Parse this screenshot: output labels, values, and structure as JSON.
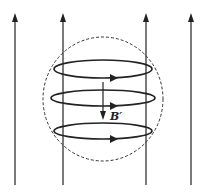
{
  "diagram": {
    "title": "",
    "field_lines": {
      "count": 4,
      "direction": "up",
      "x_positions": [
        15,
        63,
        146,
        191
      ]
    },
    "dashed_sphere": {
      "cx": 103,
      "cy": 99,
      "rx": 60,
      "ry": 62
    },
    "current_loops": [
      {
        "cy": 69,
        "direction_arrow": "right"
      },
      {
        "cy": 98,
        "direction_arrow": "right"
      },
      {
        "cy": 131,
        "direction_arrow": "right"
      }
    ],
    "induced_field": {
      "direction": "down",
      "label": "B′"
    },
    "colors": {
      "stroke": "#222222",
      "background": "#ffffff"
    }
  }
}
